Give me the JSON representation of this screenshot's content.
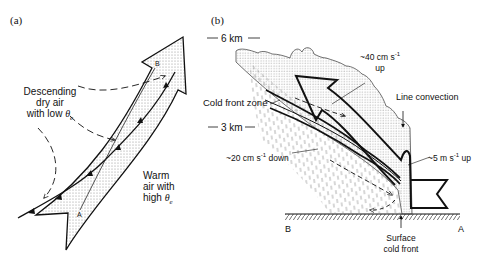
{
  "figure": {
    "panel_a": {
      "tag": "(a)",
      "label_descending": [
        "Descending",
        "dry air",
        "with low "
      ],
      "label_descending_symbol": "θ",
      "label_descending_sub": "e",
      "label_warm": [
        "Warm",
        "air with",
        "high "
      ],
      "label_warm_symbol": "θ",
      "label_warm_sub": "e",
      "point_a": "A",
      "point_b": "B"
    },
    "panel_b": {
      "tag": "(b)",
      "height_6km": "6 km",
      "height_3km": "3 km",
      "label_cold_front_zone": "Cold front zone",
      "label_40cm": "~40 cm  s",
      "label_40cm_exp": "-1",
      "label_40cm_dir": "up",
      "label_line_convection": "Line convection",
      "label_20cm": "~20 cm  s",
      "label_20cm_exp": "-1",
      "label_20cm_dir": " down",
      "label_5m": "~5 m  s",
      "label_5m_exp": "-1",
      "label_5m_dir": " up",
      "label_surface_cold_front": [
        "Surface",
        "cold front"
      ],
      "point_a": "A",
      "point_b": "B"
    },
    "colors": {
      "line": "#111111",
      "stipple": "#9a9a9a",
      "background": "#ffffff"
    }
  }
}
